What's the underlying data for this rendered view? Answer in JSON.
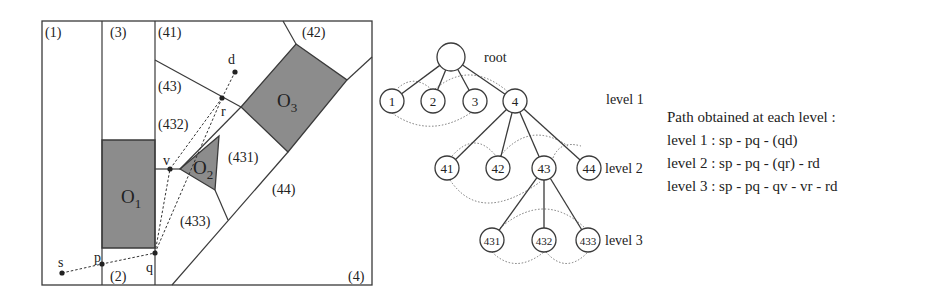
{
  "colors": {
    "ink": "#3a3a3a",
    "obstacle_fill": "#8c8c8c",
    "dotted": "#777777",
    "bg": "#ffffff"
  },
  "map": {
    "frame": {
      "x": 42,
      "y": 21,
      "w": 330,
      "h": 264
    },
    "segments": [
      [
        102,
        21,
        102,
        285
      ],
      [
        155,
        21,
        155,
        285
      ],
      [
        155,
        60,
        241,
        107
      ],
      [
        283,
        21,
        296,
        44
      ],
      [
        347,
        80,
        372,
        57
      ],
      [
        241,
        107,
        180,
        169
      ],
      [
        155,
        169,
        180,
        169
      ],
      [
        215,
        190,
        228,
        220
      ],
      [
        172,
        285,
        288,
        152
      ]
    ],
    "obstacles": [
      {
        "name": "O1",
        "label": "O",
        "sub": "1",
        "points": "102,140 155,140 155,248 102,248",
        "lx": 121,
        "ly": 203
      },
      {
        "name": "O2",
        "label": "O",
        "sub": "2",
        "points": "180,169 219,136 215,190",
        "lx": 193,
        "ly": 174
      },
      {
        "name": "O3",
        "label": "O",
        "sub": "3",
        "points": "296,44 347,80 288,152 241,107",
        "lx": 277,
        "ly": 107
      }
    ],
    "regions": [
      {
        "label": "(1)",
        "x": 45,
        "y": 37
      },
      {
        "label": "(3)",
        "x": 110,
        "y": 37
      },
      {
        "label": "(41)",
        "x": 158,
        "y": 37
      },
      {
        "label": "(42)",
        "x": 302,
        "y": 37
      },
      {
        "label": "(43)",
        "x": 158,
        "y": 91
      },
      {
        "label": "(432)",
        "x": 158,
        "y": 129
      },
      {
        "label": "(431)",
        "x": 228,
        "y": 162
      },
      {
        "label": "(44)",
        "x": 272,
        "y": 194
      },
      {
        "label": "(433)",
        "x": 180,
        "y": 226
      },
      {
        "label": "(2)",
        "x": 110,
        "y": 281
      },
      {
        "label": "(4)",
        "x": 348,
        "y": 281
      }
    ],
    "points": [
      {
        "label": "s",
        "x": 62,
        "y": 273,
        "lx": 58,
        "ly": 267
      },
      {
        "label": "p",
        "x": 102,
        "y": 264,
        "lx": 94,
        "ly": 262
      },
      {
        "label": "q",
        "x": 155,
        "y": 253,
        "lx": 146,
        "ly": 272
      },
      {
        "label": "v",
        "x": 170,
        "y": 169,
        "lx": 163,
        "ly": 165
      },
      {
        "label": "r",
        "x": 222,
        "y": 98,
        "lx": 221,
        "ly": 116
      },
      {
        "label": "d",
        "x": 235,
        "y": 72,
        "lx": 228,
        "ly": 64
      }
    ],
    "dashed_paths": [
      "62,273 102,264 155,253",
      "155,253 170,169 222,98",
      "155,253 222,98",
      "222,98 235,72"
    ]
  },
  "tree": {
    "root_label": "root",
    "root_label_pos": {
      "x": 484,
      "y": 62
    },
    "nodes": [
      {
        "id": "root",
        "label": "",
        "x": 451,
        "y": 57,
        "r": 14
      },
      {
        "id": "1",
        "label": "1",
        "x": 392,
        "y": 101,
        "r": 12
      },
      {
        "id": "2",
        "label": "2",
        "x": 433,
        "y": 101,
        "r": 12
      },
      {
        "id": "3",
        "label": "3",
        "x": 475,
        "y": 101,
        "r": 12
      },
      {
        "id": "4",
        "label": "4",
        "x": 515,
        "y": 101,
        "r": 12
      },
      {
        "id": "41",
        "label": "41",
        "x": 447,
        "y": 168,
        "r": 12
      },
      {
        "id": "42",
        "label": "42",
        "x": 498,
        "y": 168,
        "r": 12
      },
      {
        "id": "43",
        "label": "43",
        "x": 544,
        "y": 168,
        "r": 12
      },
      {
        "id": "44",
        "label": "44",
        "x": 589,
        "y": 168,
        "r": 12
      },
      {
        "id": "431",
        "label": "431",
        "x": 492,
        "y": 240,
        "r": 12
      },
      {
        "id": "432",
        "label": "432",
        "x": 544,
        "y": 240,
        "r": 12
      },
      {
        "id": "433",
        "label": "433",
        "x": 588,
        "y": 240,
        "r": 12
      }
    ],
    "edges": [
      [
        "root",
        "1"
      ],
      [
        "root",
        "2"
      ],
      [
        "root",
        "3"
      ],
      [
        "root",
        "4"
      ],
      [
        "4",
        "41"
      ],
      [
        "4",
        "42"
      ],
      [
        "4",
        "43"
      ],
      [
        "4",
        "44"
      ],
      [
        "43",
        "431"
      ],
      [
        "43",
        "432"
      ],
      [
        "43",
        "433"
      ]
    ],
    "adjacency_arcs": [
      "M 398 88 Q 414 74 431 89",
      "M 435 89 Q 470 60 507 91",
      "M 392 113 Q 430 140 472 112",
      "M 452 156 Q 475 130 496 156",
      "M 500 156 Q 530 120 568 146",
      "M 553 158 Q 560 140 581 146",
      "M 450 180 Q 480 225 540 182",
      "M 500 228 Q 545 190 585 228",
      "M 492 252 Q 515 275 544 252",
      "M 546 252 Q 566 275 588 252"
    ],
    "level_labels": [
      {
        "label": "level 1",
        "x": 606,
        "y": 104
      },
      {
        "label": "level 2",
        "x": 605,
        "y": 173
      },
      {
        "label": "level 3",
        "x": 605,
        "y": 245
      }
    ]
  },
  "path_text": {
    "title": "Path obtained at each level :",
    "lines": [
      "level 1 : sp - pq - (qd)",
      "level 2 : sp - pq - (qr) - rd",
      "level 3 : sp - pq - qv - vr - rd"
    ]
  }
}
